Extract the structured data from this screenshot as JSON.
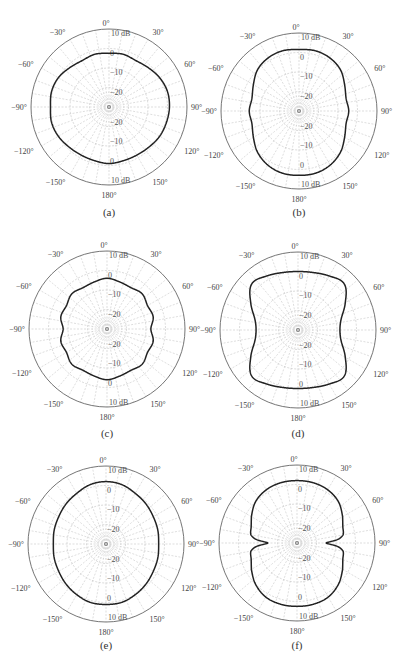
{
  "figure": {
    "panels": [
      {
        "id": "a",
        "caption": "(a)",
        "cx": 109,
        "cy": 107,
        "left": 0,
        "top": 0
      },
      {
        "id": "b",
        "caption": "(b)",
        "cx": 299,
        "cy": 111,
        "left": 0,
        "top": 0
      },
      {
        "id": "c",
        "caption": "(c)",
        "cx": 107,
        "cy": 329,
        "left": 0,
        "top": 0
      },
      {
        "id": "d",
        "caption": "(d)",
        "cx": 298,
        "cy": 330,
        "left": 0,
        "top": 0
      },
      {
        "id": "e",
        "caption": "(e)",
        "cx": 106,
        "cy": 544,
        "left": 0,
        "top": 0
      },
      {
        "id": "f",
        "caption": "(f)",
        "cx": 297,
        "cy": 543,
        "left": 0,
        "top": 0
      }
    ],
    "radius_px": 78,
    "colors": {
      "curve": "#222222",
      "outer_ring": "#666666",
      "grid": "#c8c8c8",
      "text": "#444444"
    }
  },
  "chart_data": [
    {
      "type": "polar-line",
      "panel": "(a)",
      "angle_labels": [
        "0°",
        "30°",
        "60°",
        "90°",
        "120°",
        "150°",
        "180°",
        "−150°",
        "−120°",
        "−90°",
        "−60°",
        "−30°"
      ],
      "radial_labels": [
        "10 dB",
        "0",
        "−10",
        "−20"
      ],
      "rlim": [
        -30,
        10
      ],
      "grid": true,
      "angle_step_deg": 10,
      "theta": [
        0,
        15,
        30,
        45,
        60,
        75,
        90,
        105,
        120,
        135,
        150,
        165,
        180,
        195,
        210,
        225,
        240,
        255,
        270,
        285,
        300,
        315,
        330,
        345
      ],
      "values_db": [
        -2.5,
        -2,
        -2.5,
        -1.5,
        0,
        1,
        1,
        0.5,
        0,
        -1,
        -1.5,
        -1.5,
        -1,
        -1.5,
        -1.5,
        -1,
        0,
        0.5,
        0,
        0.5,
        0,
        -1.5,
        -2.5,
        -2
      ]
    },
    {
      "type": "polar-line",
      "panel": "(b)",
      "angle_labels": [
        "0°",
        "30°",
        "60°",
        "90°",
        "120°",
        "150°",
        "180°",
        "−150°",
        "−120°",
        "−90°",
        "−60°",
        "−30°"
      ],
      "radial_labels": [
        "10 dB",
        "0",
        "−10",
        "−20"
      ],
      "rlim": [
        -30,
        10
      ],
      "grid": true,
      "angle_step_deg": 10,
      "theta": [
        0,
        15,
        30,
        45,
        60,
        75,
        90,
        105,
        120,
        135,
        150,
        165,
        180,
        195,
        210,
        225,
        240,
        255,
        270,
        285,
        300,
        315,
        330,
        345
      ],
      "values_db": [
        1.5,
        2,
        1.5,
        0,
        -3,
        -5,
        -4.5,
        -5,
        -3,
        0,
        2,
        3,
        3,
        3,
        2,
        0,
        -3,
        -5,
        -4.5,
        -5,
        -3,
        0,
        1.5,
        2
      ]
    },
    {
      "type": "polar-line",
      "panel": "(c)",
      "angle_labels": [
        "0°",
        "30°",
        "60°",
        "90°",
        "120°",
        "150°",
        "180°",
        "−150°",
        "−120°",
        "−90°",
        "−60°",
        "−30°"
      ],
      "radial_labels": [
        "10 dB",
        "0",
        "−10",
        "−20"
      ],
      "rlim": [
        -30,
        10
      ],
      "grid": true,
      "angle_step_deg": 10,
      "theta": [
        0,
        15,
        30,
        45,
        60,
        75,
        90,
        105,
        120,
        135,
        150,
        165,
        180,
        195,
        210,
        225,
        240,
        255,
        270,
        285,
        300,
        315,
        330,
        345
      ],
      "values_db": [
        -4,
        -5,
        -5.5,
        -4.5,
        -6,
        -5.5,
        -7.5,
        -5.5,
        -6,
        -4.5,
        -5.5,
        -5,
        -4,
        -5,
        -5.5,
        -4.5,
        -6,
        -5.5,
        -7.5,
        -5.5,
        -6,
        -4.5,
        -5.5,
        -5
      ]
    },
    {
      "type": "polar-line",
      "panel": "(d)",
      "angle_labels": [
        "0°",
        "30°",
        "60°",
        "90°",
        "120°",
        "150°",
        "180°",
        "−150°",
        "−120°",
        "−90°",
        "−60°",
        "−30°"
      ],
      "radial_labels": [
        "10 dB",
        "0",
        "−10",
        "−20"
      ],
      "rlim": [
        -30,
        10
      ],
      "grid": true,
      "angle_step_deg": 10,
      "theta": [
        0,
        15,
        30,
        45,
        60,
        75,
        90,
        105,
        120,
        135,
        150,
        165,
        180,
        195,
        210,
        225,
        240,
        255,
        270,
        285,
        300,
        315,
        330,
        345
      ],
      "values_db": [
        0,
        0.5,
        2,
        3.5,
        -2,
        -7,
        -8.5,
        -7,
        -2,
        3.5,
        2,
        0.5,
        0,
        0.5,
        2,
        3.5,
        -2,
        -7,
        -8.5,
        -7,
        -2,
        3.5,
        2,
        0.5
      ]
    },
    {
      "type": "polar-line",
      "panel": "(e)",
      "angle_labels": [
        "0°",
        "30°",
        "60°",
        "90°",
        "120°",
        "150°",
        "180°",
        "−150°",
        "−120°",
        "−90°",
        "−60°",
        "−30°"
      ],
      "radial_labels": [
        "10 dB",
        "0",
        "−10",
        "−20"
      ],
      "rlim": [
        -30,
        10
      ],
      "grid": true,
      "angle_step_deg": 10,
      "theta": [
        0,
        15,
        30,
        45,
        60,
        75,
        90,
        105,
        120,
        135,
        150,
        165,
        180,
        195,
        210,
        225,
        240,
        255,
        270,
        285,
        300,
        315,
        330,
        345
      ],
      "values_db": [
        2,
        1.5,
        0,
        -1,
        -2,
        -2.5,
        -3,
        -2.5,
        -2,
        -1,
        0,
        1,
        1,
        1,
        0,
        -1,
        -2,
        -2.5,
        -3,
        -2.5,
        -2,
        -1,
        0,
        1.5
      ]
    },
    {
      "type": "polar-line",
      "panel": "(f)",
      "angle_labels": [
        "0°",
        "30°",
        "60°",
        "90°",
        "120°",
        "150°",
        "180°",
        "−150°",
        "−120°",
        "−90°",
        "−60°",
        "−30°"
      ],
      "radial_labels": [
        "10 dB",
        "0",
        "−10",
        "−20"
      ],
      "rlim": [
        -30,
        10
      ],
      "grid": true,
      "angle_step_deg": 10,
      "theta": [
        0,
        15,
        30,
        45,
        60,
        70,
        80,
        85,
        90,
        95,
        100,
        110,
        120,
        135,
        150,
        165,
        180,
        195,
        210,
        225,
        240,
        250,
        260,
        265,
        270,
        275,
        280,
        290,
        300,
        315,
        330,
        345
      ],
      "values_db": [
        2,
        2,
        1.5,
        0,
        -3,
        -5,
        -6,
        -9,
        -15,
        -9,
        -6,
        -5,
        -3,
        0,
        2,
        2.5,
        2.5,
        2.5,
        2,
        0,
        -3,
        -5,
        -6,
        -9,
        -15,
        -9,
        -6,
        -5,
        -3,
        0,
        1.5,
        2
      ]
    }
  ]
}
